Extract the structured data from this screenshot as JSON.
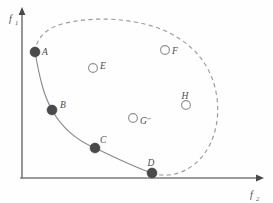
{
  "figure": {
    "title": "",
    "background_color": "#fefefe",
    "stroke_color": "#7b7b7b",
    "filled_point_color": "#4a4a4a",
    "hollow_point_color": "#ffffff",
    "hollow_point_stroke": "#909090",
    "dashed_boundary_color": "#9a9a9a",
    "pareto_curve_color": "#8a8a8a"
  },
  "axes": {
    "y": {
      "label": "f",
      "subscript": "1",
      "arrow": "up-arrow-icon"
    },
    "x": {
      "label": "f",
      "subscript": "2",
      "arrow": "right-arrow-icon"
    }
  },
  "chart_data": {
    "type": "scatter",
    "title": "",
    "xlabel": "f2",
    "ylabel": "f1",
    "grid": false,
    "legend": null,
    "xlim": [
      0,
      1
    ],
    "ylim": [
      0,
      1
    ],
    "annotations": [
      "solid curve = Pareto-optimal front through A, B, C, D",
      "dashed closed curve = boundary of the feasible objective region"
    ],
    "series": [
      {
        "name": "Pareto-optimal points (filled)",
        "marker": "filled-circle",
        "points": [
          {
            "label": "A",
            "x": 35,
            "y": 52,
            "label_dx": 7,
            "label_dy": 0,
            "label_anchor": "start"
          },
          {
            "label": "B",
            "x": 52,
            "y": 110,
            "label_dx": 8,
            "label_dy": -5,
            "label_anchor": "start"
          },
          {
            "label": "C",
            "x": 95,
            "y": 148,
            "label_dx": 5,
            "label_dy": -8,
            "label_anchor": "start"
          },
          {
            "label": "D",
            "x": 152,
            "y": 173,
            "label_dx": -1,
            "label_dy": -10,
            "label_anchor": "middle"
          }
        ]
      },
      {
        "name": "Dominated points (hollow)",
        "marker": "hollow-circle",
        "points": [
          {
            "label": "E",
            "x": 93,
            "y": 68,
            "label_dx": 7,
            "label_dy": -2,
            "label_anchor": "start"
          },
          {
            "label": "F",
            "x": 165,
            "y": 50,
            "label_dx": 7,
            "label_dy": 1,
            "label_anchor": "start"
          },
          {
            "label": "G",
            "x": 133,
            "y": 118,
            "label_dx": 7,
            "label_dy": 3,
            "label_anchor": "start"
          },
          {
            "label": "H",
            "x": 186,
            "y": 105,
            "label_dx": -1,
            "label_dy": -9,
            "label_anchor": "middle"
          }
        ]
      }
    ],
    "curves": [
      {
        "name": "pareto-front",
        "style": "solid",
        "path": "M 35 52 C 40 80, 44 96, 52 110 C 62 128, 76 140, 95 148 C 116 158, 136 168, 152 173"
      },
      {
        "name": "feasible-region-boundary",
        "style": "dashed",
        "path": "M 35 52 C 36 40, 44 29, 62 24 C 92 16, 130 18, 158 28 C 190 40, 210 62, 216 92 C 222 122, 212 152, 192 166 C 178 176, 164 177, 152 173"
      }
    ]
  }
}
